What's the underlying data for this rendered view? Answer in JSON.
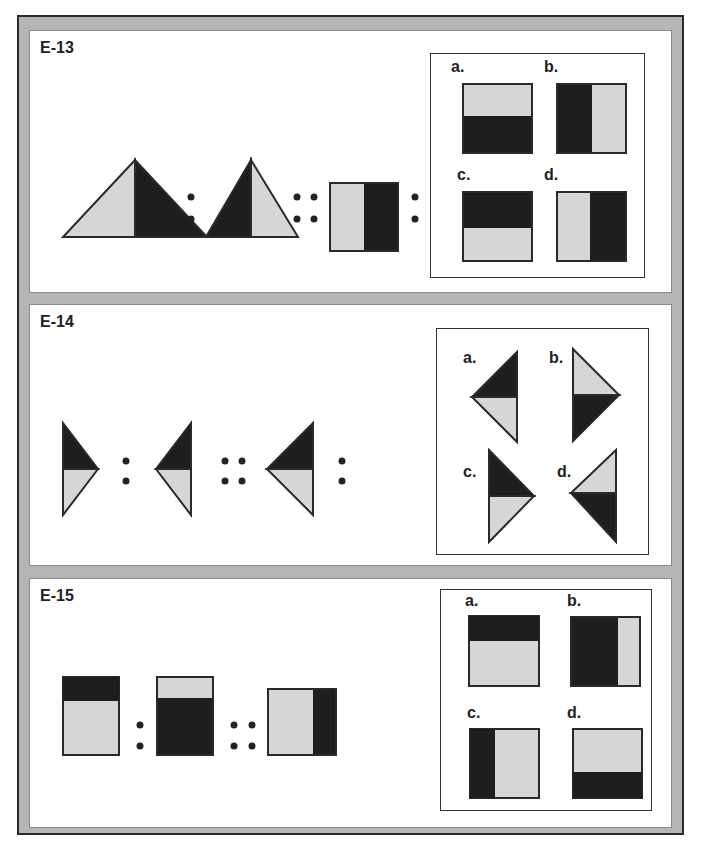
{
  "colors": {
    "dark": "#1e1e1e",
    "light": "#d6d6d6",
    "frame": "#b5b5b5",
    "stroke": "#2a2a2a"
  },
  "panels": [
    {
      "id": "E-13",
      "title": "E-13",
      "options": [
        {
          "label": "a."
        },
        {
          "label": "b."
        },
        {
          "label": "c."
        },
        {
          "label": "d."
        }
      ]
    },
    {
      "id": "E-14",
      "title": "E-14",
      "options": [
        {
          "label": "a."
        },
        {
          "label": "b."
        },
        {
          "label": "c."
        },
        {
          "label": "d."
        }
      ]
    },
    {
      "id": "E-15",
      "title": "E-15",
      "options": [
        {
          "label": "a."
        },
        {
          "label": "b."
        },
        {
          "label": "c."
        },
        {
          "label": "d."
        }
      ]
    }
  ],
  "separators": {
    "ratio": ":",
    "analogy": "::"
  }
}
